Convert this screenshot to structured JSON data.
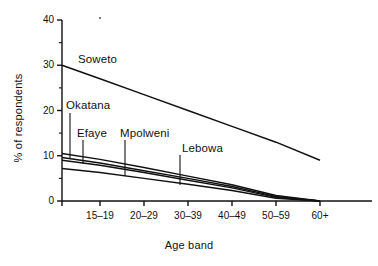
{
  "chart_data": {
    "type": "line",
    "title": "",
    "xlabel": "Age band",
    "ylabel": "% of respondents",
    "categories": [
      "15-19",
      "20-29",
      "30-39",
      "40-49",
      "50-59",
      "60+"
    ],
    "x_tick_labels": [
      "15–19",
      "20–29",
      "30–39",
      "40–49",
      "50–59",
      "60+"
    ],
    "y_tick_labels": [
      "0",
      "10",
      "20",
      "30",
      "40"
    ],
    "y_tick_values": [
      0,
      10,
      20,
      30,
      40
    ],
    "y_minor_tick_values": [
      5,
      15,
      25,
      35
    ],
    "ylim": [
      0,
      40
    ],
    "grid": false,
    "legend_position": "inline-leader-labels",
    "series": [
      {
        "name": "Soweto",
        "label": "Soweto",
        "color": "#111111",
        "x": [
          "start",
          "15-19",
          "20-29",
          "30-39",
          "40-49",
          "50-59",
          "60+"
        ],
        "values": [
          30.0,
          27.0,
          23.5,
          20.0,
          16.5,
          13.0,
          9.0
        ]
      },
      {
        "name": "Okatana",
        "label": "Okatana",
        "color": "#111111",
        "x": [
          "start",
          "15-19",
          "20-29",
          "30-39",
          "40-49",
          "50-59",
          "60+"
        ],
        "values": [
          10.5,
          9.2,
          7.4,
          5.5,
          3.6,
          1.2,
          0.0
        ]
      },
      {
        "name": "Efaye",
        "label": "Efaye",
        "color": "#111111",
        "x": [
          "start",
          "15-19",
          "20-29",
          "30-39",
          "40-49",
          "50-59",
          "60+"
        ],
        "values": [
          9.6,
          8.4,
          6.7,
          5.0,
          3.2,
          1.0,
          0.0
        ]
      },
      {
        "name": "Mpolweni",
        "label": "Mpolweni",
        "color": "#111111",
        "x": [
          "start",
          "15-19",
          "20-29",
          "30-39",
          "40-49",
          "50-59",
          "60+"
        ],
        "values": [
          9.0,
          7.9,
          6.3,
          4.6,
          2.9,
          0.8,
          0.0
        ]
      },
      {
        "name": "Lebowa",
        "label": "Lebowa",
        "color": "#111111",
        "x": [
          "start",
          "15-19",
          "20-29",
          "30-39",
          "40-49",
          "50-59",
          "60+"
        ],
        "values": [
          7.2,
          6.3,
          5.0,
          3.7,
          2.3,
          0.6,
          0.0
        ]
      }
    ],
    "annotations": [
      {
        "text": "Soweto",
        "leader": false
      },
      {
        "text": "Okatana",
        "leader": true
      },
      {
        "text": "Efaye",
        "leader": true
      },
      {
        "text": "Mpolweni",
        "leader": true
      },
      {
        "text": "Lebowa",
        "leader": true
      }
    ]
  }
}
